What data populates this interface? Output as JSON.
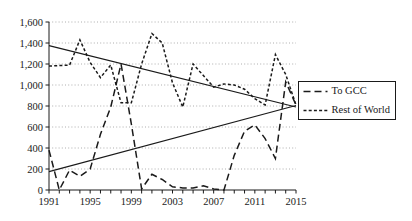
{
  "chart_data": {
    "type": "line",
    "title": "",
    "xlabel": "",
    "ylabel": "",
    "xlim": [
      1991,
      2015
    ],
    "ylim": [
      0,
      1600
    ],
    "yticks": [
      0,
      200,
      400,
      600,
      800,
      1000,
      1200,
      1400,
      1600
    ],
    "ytick_labels": [
      "0",
      "200",
      "400",
      "600",
      "800",
      "1,000",
      "1,200",
      "1,400",
      "1,600"
    ],
    "xticks": [
      1991,
      1992,
      1993,
      1994,
      1995,
      1996,
      1997,
      1998,
      1999,
      2000,
      2001,
      2002,
      2003,
      2004,
      2005,
      2006,
      2007,
      2008,
      2009,
      2010,
      2011,
      2012,
      2013,
      2014,
      2015
    ],
    "xtick_labels_shown": [
      "1991",
      "1995",
      "1999",
      "2003",
      "2007",
      "2011",
      "2015"
    ],
    "grid": "horizontal-dotted",
    "legend_position": "right",
    "x": [
      1991,
      1992,
      1993,
      1994,
      1995,
      1996,
      1997,
      1998,
      1999,
      2000,
      2001,
      2002,
      2003,
      2004,
      2005,
      2006,
      2007,
      2008,
      2009,
      2010,
      2011,
      2012,
      2013,
      2014,
      2015
    ],
    "series": [
      {
        "name": "To GCC",
        "dash": "long-dash",
        "color": "#1a1a1a",
        "values": [
          380,
          0,
          190,
          130,
          200,
          530,
          790,
          1200,
          630,
          10,
          150,
          100,
          30,
          20,
          20,
          40,
          10,
          0,
          330,
          560,
          620,
          490,
          300,
          1030,
          810
        ]
      },
      {
        "name": "Rest of World",
        "dash": "short-dash",
        "color": "#1a1a1a",
        "values": [
          1180,
          1185,
          1190,
          1430,
          1215,
          1070,
          1190,
          830,
          830,
          1200,
          1490,
          1400,
          1020,
          790,
          1200,
          1090,
          980,
          1010,
          1000,
          960,
          870,
          810,
          1290,
          1100,
          810
        ]
      }
    ],
    "trendlines": [
      {
        "name": "rest-of-world-trend",
        "start": {
          "x": 1991,
          "y": 1375
        },
        "end": {
          "x": 2015,
          "y": 790
        },
        "style": "solid"
      },
      {
        "name": "to-gcc-trend",
        "start": {
          "x": 1991,
          "y": 175
        },
        "end": {
          "x": 2015,
          "y": 805
        },
        "style": "solid"
      }
    ],
    "legend": [
      {
        "label": "To GCC",
        "dash": "long-dash"
      },
      {
        "label": "Rest of World",
        "dash": "short-dash"
      }
    ]
  }
}
